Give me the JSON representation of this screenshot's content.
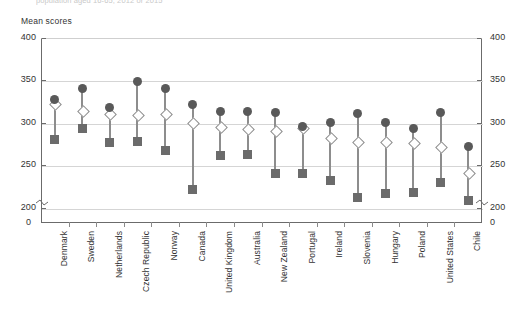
{
  "top_caption": "population aged 16-65, 2012 or 2015",
  "chart_data": {
    "type": "scatter",
    "title": "",
    "ylabel": "Mean scores",
    "xlabel": "",
    "ylim": [
      195,
      400
    ],
    "yticks": [
      400,
      350,
      300,
      250,
      200
    ],
    "y_axis_break": true,
    "y_axis_zero_label": "0",
    "grid": "horizontal",
    "legend_position": "none",
    "dual_y_axis": true,
    "categories": [
      "Denmark",
      "Sweden",
      "Netherlands",
      "Czech Republic",
      "Norway",
      "Canada",
      "United Kingdom",
      "Australia",
      "New Zealand",
      "Portugal",
      "Ireland",
      "Slovenia",
      "Hungary",
      "Poland",
      "United States",
      "Chile"
    ],
    "series": [
      {
        "name": "High score",
        "marker": "filled-circle",
        "color": "#595959",
        "values": [
          327,
          340,
          318,
          349,
          341,
          322,
          313,
          313,
          312,
          296,
          301,
          311,
          301,
          293,
          312,
          272
        ]
      },
      {
        "name": "Median score",
        "marker": "open-diamond",
        "color": "#8d8d8d",
        "values": [
          323,
          314,
          311,
          310,
          311,
          301,
          296,
          293,
          291,
          294,
          283,
          278,
          278,
          277,
          272,
          242
        ]
      },
      {
        "name": "Low score",
        "marker": "filled-square",
        "color": "#6b6b6b",
        "values": [
          280,
          293,
          277,
          278,
          267,
          221,
          262,
          263,
          240,
          240,
          232,
          212,
          217,
          218,
          230,
          208
        ]
      }
    ]
  }
}
